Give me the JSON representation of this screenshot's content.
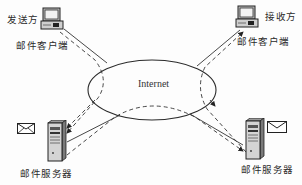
{
  "diagram": {
    "type": "email-transfer-network",
    "network": {
      "label": "Internet"
    },
    "sender": {
      "role_label": "发送方",
      "client_label": "邮件客户端",
      "icon": "computer-icon"
    },
    "receiver": {
      "role_label": "接收方",
      "client_label": "邮件客户端",
      "icon": "computer-icon"
    },
    "sender_server": {
      "label": "邮件服务器",
      "icon": "server-icon",
      "message_icon": "envelope-icon"
    },
    "receiver_server": {
      "label": "邮件服务器",
      "icon": "server-icon",
      "message_icon": "envelope-icon"
    },
    "edges": [
      {
        "from": "sender_client",
        "to": "internet",
        "style": "solid"
      },
      {
        "from": "sender_client",
        "to": "sender_server",
        "style": "dashed",
        "arrow": "end"
      },
      {
        "from": "internet",
        "to": "receiver_client",
        "style": "solid"
      },
      {
        "from": "receiver_server",
        "to": "receiver_client",
        "style": "dashed",
        "arrow": "end"
      },
      {
        "from": "sender_server",
        "to": "internet",
        "style": "solid"
      },
      {
        "from": "sender_server",
        "to": "receiver_server",
        "style": "dashed",
        "arrow": "end"
      },
      {
        "from": "internet",
        "to": "receiver_server",
        "style": "solid"
      }
    ],
    "colors": {
      "line": "#333333",
      "background": "#fdfdfd"
    }
  }
}
